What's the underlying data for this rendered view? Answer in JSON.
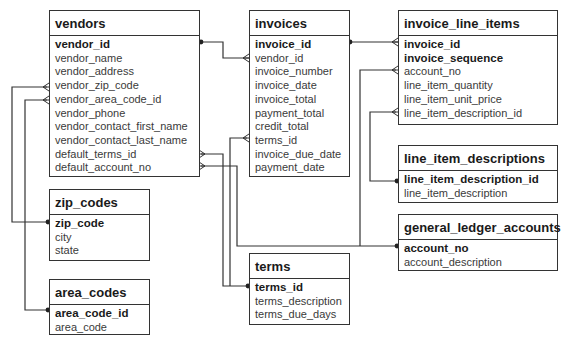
{
  "diagram": {
    "type": "entity-relationship",
    "tables": {
      "vendors": {
        "name": "vendors",
        "fields": [
          {
            "name": "vendor_id",
            "pk": true
          },
          {
            "name": "vendor_name",
            "pk": false
          },
          {
            "name": "vendor_address",
            "pk": false
          },
          {
            "name": "vendor_zip_code",
            "pk": false
          },
          {
            "name": "vendor_area_code_id",
            "pk": false
          },
          {
            "name": "vendor_phone",
            "pk": false
          },
          {
            "name": "vendor_contact_first_name",
            "pk": false
          },
          {
            "name": "vendor_contact_last_name",
            "pk": false
          },
          {
            "name": "default_terms_id",
            "pk": false
          },
          {
            "name": "default_account_no",
            "pk": false
          }
        ]
      },
      "invoices": {
        "name": "invoices",
        "fields": [
          {
            "name": "invoice_id",
            "pk": true
          },
          {
            "name": "vendor_id",
            "pk": false
          },
          {
            "name": "invoice_number",
            "pk": false
          },
          {
            "name": "invoice_date",
            "pk": false
          },
          {
            "name": "invoice_total",
            "pk": false
          },
          {
            "name": "payment_total",
            "pk": false
          },
          {
            "name": "credit_total",
            "pk": false
          },
          {
            "name": "terms_id",
            "pk": false
          },
          {
            "name": "invoice_due_date",
            "pk": false
          },
          {
            "name": "payment_date",
            "pk": false
          }
        ]
      },
      "invoice_line_items": {
        "name": "invoice_line_items",
        "fields": [
          {
            "name": "invoice_id",
            "pk": true
          },
          {
            "name": "invoice_sequence",
            "pk": true
          },
          {
            "name": "account_no",
            "pk": false
          },
          {
            "name": "line_item_quantity",
            "pk": false
          },
          {
            "name": "line_item_unit_price",
            "pk": false
          },
          {
            "name": "line_item_description_id",
            "pk": false
          }
        ]
      },
      "line_item_descriptions": {
        "name": "line_item_descriptions",
        "fields": [
          {
            "name": "line_item_description_id",
            "pk": true
          },
          {
            "name": "line_item_description",
            "pk": false
          }
        ]
      },
      "general_ledger_accounts": {
        "name": "general_ledger_accounts",
        "fields": [
          {
            "name": "account_no",
            "pk": true
          },
          {
            "name": "account_description",
            "pk": false
          }
        ]
      },
      "zip_codes": {
        "name": "zip_codes",
        "fields": [
          {
            "name": "zip_code",
            "pk": true
          },
          {
            "name": "city",
            "pk": false
          },
          {
            "name": "state",
            "pk": false
          }
        ]
      },
      "area_codes": {
        "name": "area_codes",
        "fields": [
          {
            "name": "area_code_id",
            "pk": true
          },
          {
            "name": "area_code",
            "pk": false
          }
        ]
      },
      "terms": {
        "name": "terms",
        "fields": [
          {
            "name": "terms_id",
            "pk": true
          },
          {
            "name": "terms_description",
            "pk": false
          },
          {
            "name": "terms_due_days",
            "pk": false
          }
        ]
      }
    },
    "relationships": [
      {
        "from": "vendors.vendor_id",
        "to": "invoices.vendor_id",
        "cardinality": "one-to-many"
      },
      {
        "from": "invoices.invoice_id",
        "to": "invoice_line_items.invoice_id",
        "cardinality": "one-to-many"
      },
      {
        "from": "zip_codes.zip_code",
        "to": "vendors.vendor_zip_code",
        "cardinality": "one-to-many"
      },
      {
        "from": "area_codes.area_code_id",
        "to": "vendors.vendor_area_code_id",
        "cardinality": "one-to-many"
      },
      {
        "from": "terms.terms_id",
        "to": "vendors.default_terms_id",
        "cardinality": "one-to-many"
      },
      {
        "from": "terms.terms_id",
        "to": "invoices.terms_id",
        "cardinality": "one-to-many"
      },
      {
        "from": "general_ledger_accounts.account_no",
        "to": "vendors.default_account_no",
        "cardinality": "one-to-many"
      },
      {
        "from": "general_ledger_accounts.account_no",
        "to": "invoice_line_items.account_no",
        "cardinality": "one-to-many"
      },
      {
        "from": "line_item_descriptions.line_item_description_id",
        "to": "invoice_line_items.line_item_description_id",
        "cardinality": "one-to-many"
      }
    ]
  }
}
